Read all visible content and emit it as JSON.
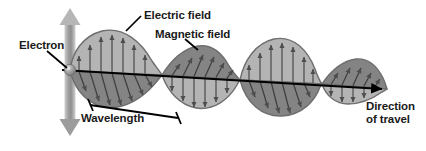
{
  "figure": {
    "type": "diagram",
    "background_color": "#ffffff",
    "line_color": "#000000",
    "text_color": "#1a1a1a"
  },
  "labels": {
    "electron": "Electron",
    "electric_field": "Electric field",
    "magnetic_field": "Magnetic field",
    "wavelength": "Wavelength",
    "direction_line1": "Direction",
    "direction_line2": "of travel"
  },
  "colors": {
    "electric_lobe_fill": "#b4b4b4",
    "magnetic_lobe_fill": "#848484",
    "lobe_outline": "#6e6e6e",
    "arrow_gray": "#4d4d4d",
    "electron_body": "#9a9a9a",
    "electron_highlight": "#d8d8d8",
    "oscillation_arrow": "#a0a0a0",
    "axis": "#000000"
  },
  "elements": {
    "electron_sphere": "electron-sphere",
    "oscillation_arrow": "vertical-double-arrow",
    "propagation_axis": "direction-of-travel-arrow",
    "wavelength_bracket": "wavelength-bracket",
    "electric_field_lobes": 3,
    "magnetic_field_lobes": 3
  }
}
